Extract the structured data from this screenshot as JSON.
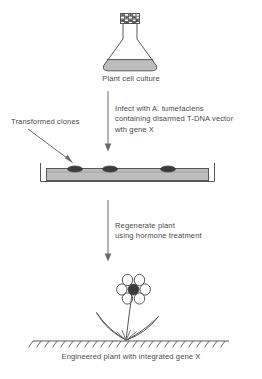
{
  "figure": {
    "background_color": "#ffffff",
    "ink_color": "#565656",
    "text_color": "#4a4a4a",
    "fill_color": "#bdbdbd",
    "dark_color": "#3c3c3c",
    "width": 262,
    "height": 379
  },
  "steps": {
    "flask_caption": "Plant cell culture",
    "clones_label": "Transformed clones",
    "infect_line1_pre": "Infect with ",
    "infect_line1_italic": "A. tumefaciens",
    "infect_line2": "containing disarmed T-DNA vector",
    "infect_line3_pre": "wth gene ",
    "infect_line3_italic": "X",
    "regenerate_line1": "Regenerate plant",
    "regenerate_line2": "using hormone treatment",
    "final_caption_pre": "Engineered plant with integrated gene ",
    "final_caption_italic": "X"
  },
  "icons": {
    "flask": "erlenmeyer-flask-icon",
    "stopper": "flask-stopper-icon",
    "tray": "culture-tray-icon",
    "colony": "clone-colony-icon",
    "flower": "flower-icon",
    "leaf": "leaf-icon",
    "ground": "ground-hatching-icon",
    "arrow": "down-arrow-icon",
    "pointer": "pointer-arrow-icon"
  },
  "counts": {
    "colonies": 3,
    "petals": 6,
    "leaves": 2
  }
}
